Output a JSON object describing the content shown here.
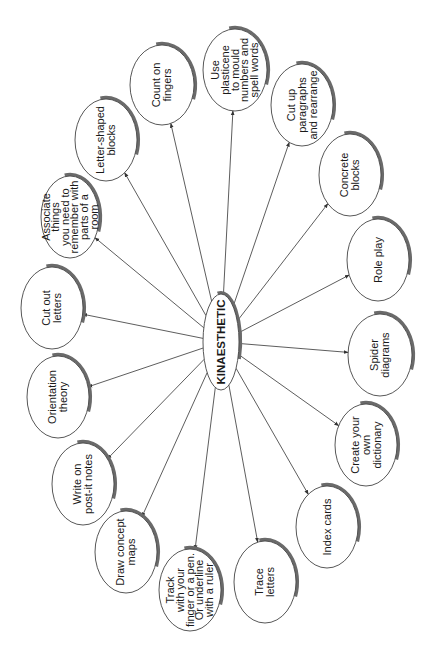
{
  "diagram": {
    "type": "mind-map",
    "orientation": "rotated-90-ccw",
    "center": {
      "label": "KINAESTHETIC",
      "x": 221,
      "y": 342,
      "rx": 18,
      "ry": 48
    },
    "nodes": [
      {
        "id": "count-on-fingers",
        "lines": [
          "Count on",
          "fingers"
        ],
        "x": 162,
        "y": 85,
        "rx": 32,
        "ry": 40
      },
      {
        "id": "use-plasticene",
        "lines": [
          "Use",
          "plasticene",
          "to mould",
          "numbers and",
          "spell words"
        ],
        "x": 235,
        "y": 70,
        "rx": 32,
        "ry": 41
      },
      {
        "id": "cut-up-paragraphs",
        "lines": [
          "Cut up",
          "paragraphs",
          "and rearrange"
        ],
        "x": 302,
        "y": 105,
        "rx": 31,
        "ry": 41
      },
      {
        "id": "letter-shaped-blocks",
        "lines": [
          "Letter-shaped",
          "blocks"
        ],
        "x": 106,
        "y": 140,
        "rx": 31,
        "ry": 41
      },
      {
        "id": "associate-things",
        "lines": [
          "Associate",
          "things",
          "you need to",
          "remember with",
          "parts of a",
          "room"
        ],
        "x": 70,
        "y": 217,
        "rx": 29,
        "ry": 41
      },
      {
        "id": "concrete-blocks",
        "lines": [
          "Concrete",
          "blocks"
        ],
        "x": 350,
        "y": 175,
        "rx": 31,
        "ry": 41
      },
      {
        "id": "cut-out-letters",
        "lines": [
          "Cut out",
          "letters"
        ],
        "x": 52,
        "y": 308,
        "rx": 31,
        "ry": 41
      },
      {
        "id": "role-play",
        "lines": [
          "Role play"
        ],
        "x": 378,
        "y": 260,
        "rx": 31,
        "ry": 41
      },
      {
        "id": "orientation-theory",
        "lines": [
          "Orientation",
          "theory"
        ],
        "x": 58,
        "y": 397,
        "rx": 31,
        "ry": 41
      },
      {
        "id": "spider-diagrams",
        "lines": [
          "Spider",
          "diagrams"
        ],
        "x": 380,
        "y": 355,
        "rx": 32,
        "ry": 41
      },
      {
        "id": "write-on-post-it-notes",
        "lines": [
          "Write on",
          "post-it notes"
        ],
        "x": 83,
        "y": 484,
        "rx": 31,
        "ry": 41
      },
      {
        "id": "create-your-own-dictionary",
        "lines": [
          "Create your",
          "own",
          "dictionary"
        ],
        "x": 366,
        "y": 445,
        "rx": 31,
        "ry": 41
      },
      {
        "id": "draw-concept-maps",
        "lines": [
          "Draw concept",
          "maps"
        ],
        "x": 126,
        "y": 552,
        "rx": 31,
        "ry": 41
      },
      {
        "id": "index-cards",
        "lines": [
          "Index cards"
        ],
        "x": 327,
        "y": 527,
        "rx": 31,
        "ry": 41
      },
      {
        "id": "track-with-finger",
        "lines": [
          "Track",
          "with your",
          "finger or a pen.",
          "Or underline",
          "with a ruler"
        ],
        "x": 190,
        "y": 590,
        "rx": 31,
        "ry": 41
      },
      {
        "id": "trace-letters",
        "lines": [
          "Trace",
          "letters"
        ],
        "x": 265,
        "y": 582,
        "rx": 31,
        "ry": 41
      }
    ]
  }
}
